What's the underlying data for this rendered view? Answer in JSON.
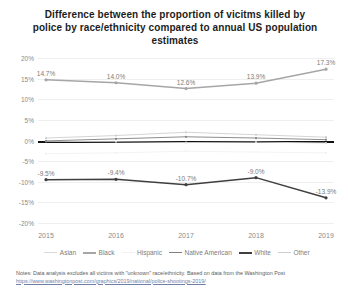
{
  "title": "Difference between the proportion of vicitms killed by police by race/ethnicity compared to annual US population estimates",
  "notes": {
    "text": "Notes: Data analysis excludes all victims with \"unknown\" race/ethnicity. Based on data from the Washington Post ",
    "url": "https://www.washingtonpost.com/graphics/2019/national/police-shootings-2019/"
  },
  "chart_data": {
    "type": "line",
    "title": "Difference between the proportion of vicitms killed by police by race/ethnicity compared to annual US population estimates",
    "xlabel": "",
    "ylabel": "",
    "categories": [
      "2015",
      "2016",
      "2017",
      "2018",
      "2019"
    ],
    "ylim": [
      -20,
      20
    ],
    "yticks": [
      "20%",
      "15%",
      "10%",
      "5%",
      "0%",
      "-5%",
      "-10%",
      "-15%",
      "-20%"
    ],
    "ytick_values": [
      20,
      15,
      10,
      5,
      0,
      -5,
      -10,
      -15,
      -20
    ],
    "grid": true,
    "legend_position": "bottom",
    "series": [
      {
        "name": "Asian",
        "color": "#d9d9d9",
        "values": [
          -0.2,
          -0.3,
          -0.5,
          -0.4,
          -0.6
        ],
        "labels": [
          "",
          "",
          "",
          "",
          ""
        ]
      },
      {
        "name": "Black",
        "color": "#a6a6a6",
        "values": [
          14.7,
          14.0,
          12.6,
          13.9,
          17.3
        ],
        "labels": [
          "14.7%",
          "14.0%",
          "12.6%",
          "13.9%",
          "17.3%"
        ]
      },
      {
        "name": "Hispanic",
        "color": "#f2f2f2",
        "values": [
          -3.2,
          -3.0,
          -2.6,
          -2.8,
          -3.0
        ],
        "labels": [
          "",
          "",
          "",
          "",
          ""
        ]
      },
      {
        "name": "Native American",
        "color": "#808080",
        "values": [
          -0.1,
          0.4,
          0.9,
          0.6,
          0.2
        ],
        "labels": [
          "",
          "",
          "",
          "",
          ""
        ]
      },
      {
        "name": "White",
        "color": "#3f3f3f",
        "values": [
          -9.5,
          -9.4,
          -10.7,
          -9.0,
          -13.9
        ],
        "labels": [
          "-9.5%",
          "-9.4%",
          "-10.7%",
          "-9.0%",
          "-13.9%"
        ]
      },
      {
        "name": "Other",
        "color": "#cfcfcf",
        "values": [
          0.6,
          1.2,
          2.0,
          1.4,
          0.8
        ],
        "labels": [
          "",
          "",
          "",
          "",
          ""
        ]
      }
    ]
  }
}
